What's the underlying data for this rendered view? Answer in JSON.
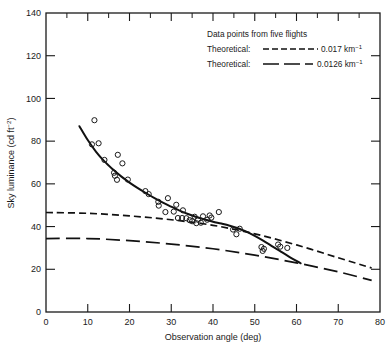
{
  "chart_data": {
    "type": "scatter",
    "title": "",
    "xlabel": "Observation angle (deg)",
    "ylabel": "Sky luminance (cd ft⁻²)",
    "xlim": [
      0,
      80
    ],
    "ylim": [
      0,
      140
    ],
    "xticks": [
      0,
      10,
      20,
      30,
      40,
      50,
      60,
      70,
      80
    ],
    "yticks": [
      0,
      20,
      40,
      60,
      80,
      100,
      120,
      140
    ],
    "xtick_labels": [
      "0",
      "10",
      "20",
      "30",
      "40",
      "50",
      "60",
      "70",
      "80"
    ],
    "ytick_labels": [
      "0",
      "20",
      "40",
      "60",
      "80",
      "100",
      "120",
      "140"
    ],
    "grid": false,
    "legend_position": "top-right",
    "legend": [
      {
        "label": "Data points from five flights",
        "marker": "open-circle",
        "line": "none"
      },
      {
        "label": "Theoretical:",
        "value": "0.017 km⁻¹",
        "line": "short-dash"
      },
      {
        "label": "Theoretical:",
        "value": "0.0126 km⁻¹",
        "line": "long-dash"
      }
    ],
    "scatter_points": [
      {
        "x": 11.0,
        "y": 78.5
      },
      {
        "x": 11.6,
        "y": 89.8
      },
      {
        "x": 12.6,
        "y": 79.0
      },
      {
        "x": 14.0,
        "y": 71.2
      },
      {
        "x": 16.3,
        "y": 65.2
      },
      {
        "x": 16.5,
        "y": 63.8
      },
      {
        "x": 17.2,
        "y": 73.6
      },
      {
        "x": 17.0,
        "y": 61.9
      },
      {
        "x": 18.3,
        "y": 69.6
      },
      {
        "x": 19.6,
        "y": 62.0
      },
      {
        "x": 23.8,
        "y": 56.6
      },
      {
        "x": 24.6,
        "y": 55.2
      },
      {
        "x": 26.9,
        "y": 51.6
      },
      {
        "x": 27.0,
        "y": 49.8
      },
      {
        "x": 28.6,
        "y": 46.8
      },
      {
        "x": 29.2,
        "y": 53.3
      },
      {
        "x": 30.6,
        "y": 47.0
      },
      {
        "x": 31.2,
        "y": 50.2
      },
      {
        "x": 31.6,
        "y": 44.0
      },
      {
        "x": 32.6,
        "y": 44.0
      },
      {
        "x": 32.8,
        "y": 47.6
      },
      {
        "x": 33.6,
        "y": 43.9
      },
      {
        "x": 34.4,
        "y": 43.0
      },
      {
        "x": 35.0,
        "y": 42.5
      },
      {
        "x": 35.6,
        "y": 44.6
      },
      {
        "x": 36.0,
        "y": 41.6
      },
      {
        "x": 36.4,
        "y": 43.2
      },
      {
        "x": 37.1,
        "y": 41.8
      },
      {
        "x": 37.6,
        "y": 44.8
      },
      {
        "x": 38.6,
        "y": 43.2
      },
      {
        "x": 39.2,
        "y": 45.2
      },
      {
        "x": 39.6,
        "y": 44.2
      },
      {
        "x": 41.4,
        "y": 46.8
      },
      {
        "x": 44.8,
        "y": 38.6
      },
      {
        "x": 45.6,
        "y": 36.4
      },
      {
        "x": 46.4,
        "y": 39.0
      },
      {
        "x": 51.6,
        "y": 30.4
      },
      {
        "x": 51.9,
        "y": 28.6
      },
      {
        "x": 52.2,
        "y": 29.6
      },
      {
        "x": 55.6,
        "y": 31.6
      },
      {
        "x": 56.1,
        "y": 30.6
      },
      {
        "x": 57.8,
        "y": 30.0
      }
    ],
    "series": [
      {
        "name": "Fitted curve through data points",
        "line": "solid",
        "points": [
          {
            "x": 8.0,
            "y": 87.0
          },
          {
            "x": 10.0,
            "y": 80.5
          },
          {
            "x": 12.0,
            "y": 75.0
          },
          {
            "x": 14.0,
            "y": 70.5
          },
          {
            "x": 16.0,
            "y": 66.8
          },
          {
            "x": 18.0,
            "y": 63.5
          },
          {
            "x": 20.0,
            "y": 60.6
          },
          {
            "x": 22.0,
            "y": 58.0
          },
          {
            "x": 24.0,
            "y": 55.6
          },
          {
            "x": 26.0,
            "y": 53.3
          },
          {
            "x": 28.0,
            "y": 51.2
          },
          {
            "x": 30.0,
            "y": 49.3
          },
          {
            "x": 32.0,
            "y": 47.5
          },
          {
            "x": 34.0,
            "y": 45.9
          },
          {
            "x": 36.0,
            "y": 44.5
          },
          {
            "x": 38.0,
            "y": 43.3
          },
          {
            "x": 40.0,
            "y": 42.3
          },
          {
            "x": 42.0,
            "y": 41.4
          },
          {
            "x": 44.0,
            "y": 40.4
          },
          {
            "x": 46.0,
            "y": 39.2
          },
          {
            "x": 48.0,
            "y": 37.6
          },
          {
            "x": 50.0,
            "y": 35.6
          },
          {
            "x": 52.0,
            "y": 33.4
          },
          {
            "x": 54.0,
            "y": 31.0
          },
          {
            "x": 56.0,
            "y": 28.6
          },
          {
            "x": 58.0,
            "y": 26.2
          },
          {
            "x": 61.0,
            "y": 22.8
          }
        ]
      },
      {
        "name": "Theoretical 0.017 km-1",
        "line": "short-dash",
        "points": [
          {
            "x": 0.0,
            "y": 46.6
          },
          {
            "x": 10.0,
            "y": 46.2
          },
          {
            "x": 20.0,
            "y": 45.0
          },
          {
            "x": 30.0,
            "y": 43.2
          },
          {
            "x": 40.0,
            "y": 40.6
          },
          {
            "x": 50.0,
            "y": 36.6
          },
          {
            "x": 60.0,
            "y": 31.4
          },
          {
            "x": 70.0,
            "y": 25.4
          },
          {
            "x": 78.0,
            "y": 20.6
          }
        ]
      },
      {
        "name": "Theoretical 0.0126 km-1",
        "line": "long-dash",
        "points": [
          {
            "x": 0.0,
            "y": 34.4
          },
          {
            "x": 10.0,
            "y": 34.4
          },
          {
            "x": 20.0,
            "y": 33.4
          },
          {
            "x": 30.0,
            "y": 31.8
          },
          {
            "x": 40.0,
            "y": 29.6
          },
          {
            "x": 50.0,
            "y": 26.6
          },
          {
            "x": 60.0,
            "y": 23.0
          },
          {
            "x": 70.0,
            "y": 18.8
          },
          {
            "x": 78.0,
            "y": 14.8
          }
        ]
      }
    ]
  },
  "legend_block": {
    "line1": "Data points from five flights",
    "line2_label": "Theoretical:",
    "line2_value": "0.017 km",
    "line2_exp": "−1",
    "line3_label": "Theoretical:",
    "line3_value": "0.0126 km",
    "line3_exp": "−1"
  },
  "axes": {
    "x_title": "Observation angle (deg)",
    "y_title_main": "Sky luminance (cd ft",
    "y_title_exp": "−2",
    "y_title_close": ")"
  }
}
